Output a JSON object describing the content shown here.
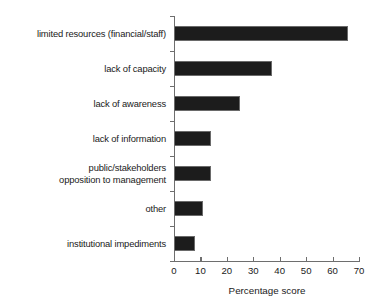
{
  "chart_data": {
    "type": "bar",
    "orientation": "horizontal",
    "title": "",
    "xlabel": "Percentage score",
    "ylabel": "",
    "xlim": [
      0,
      70
    ],
    "xticks": [
      0,
      10,
      20,
      30,
      40,
      50,
      60,
      70
    ],
    "grid": false,
    "legend": null,
    "bar_color": "#1c1c1c",
    "axis_color": "#6e6e6e",
    "categories": [
      "limited resources (financial/staff)",
      "lack of capacity",
      "lack of awareness",
      "lack of information",
      "public/stakeholders\nopposition to management",
      "other",
      "institutional impediments"
    ],
    "values": [
      66,
      37,
      25,
      14,
      14,
      11,
      8
    ]
  }
}
